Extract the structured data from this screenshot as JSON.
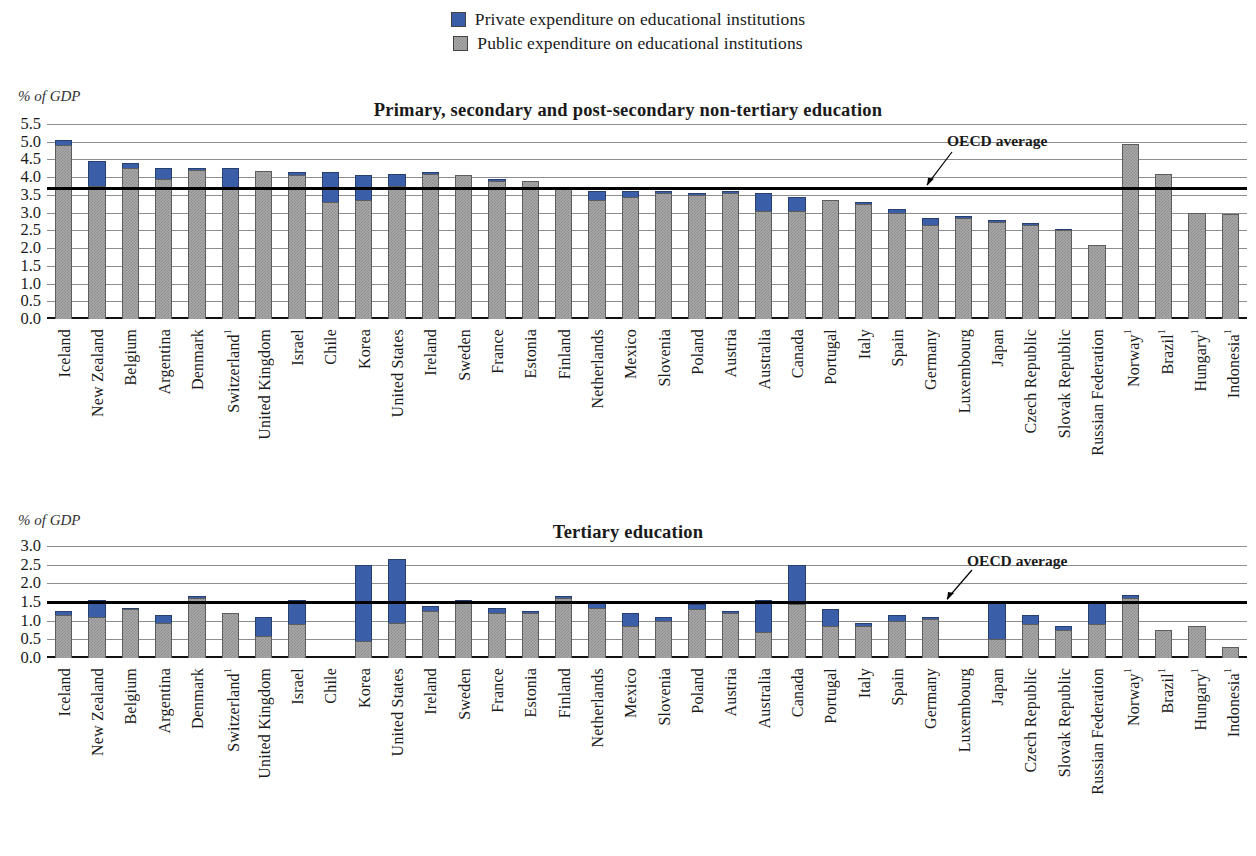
{
  "legend": {
    "items": [
      {
        "label": "Private expenditure on educational institutions",
        "color": "#3a5fa8",
        "key": "private"
      },
      {
        "label": "Public expenditure on educational institutions",
        "color": "#a9a9a9",
        "key": "public"
      }
    ]
  },
  "panels": [
    {
      "id": "top",
      "title": "Primary, secondary and post-secondary non-tertiary education",
      "axis_label": "% of GDP",
      "oecd_label": "OECD average"
    },
    {
      "id": "bottom",
      "title": "Tertiary education",
      "axis_label": "% of GDP",
      "oecd_label": "OECD average"
    }
  ],
  "chart_data": [
    {
      "type": "bar",
      "stacked": true,
      "title": "Primary, secondary and post-secondary non-tertiary education",
      "xlabel": "",
      "ylabel": "% of GDP",
      "ylim": [
        0.0,
        5.5
      ],
      "yticks": [
        "0.0",
        "0.5",
        "1.0",
        "1.5",
        "2.0",
        "2.5",
        "3.0",
        "3.5",
        "4.0",
        "4.5",
        "5.0",
        "5.5"
      ],
      "grid": true,
      "legend_position": "top-center",
      "annotations": [
        {
          "text": "OECD average",
          "value": 3.7
        }
      ],
      "oecd_average": 3.7,
      "categories": [
        "Iceland",
        "New Zealand",
        "Belgium",
        "Argentina",
        "Denmark",
        "Switzerland¹",
        "United Kingdom",
        "Israel",
        "Chile",
        "Korea",
        "United States",
        "Ireland",
        "Sweden",
        "France",
        "Estonia",
        "Finland",
        "Netherlands",
        "Mexico",
        "Slovenia",
        "Poland",
        "Austria",
        "Australia",
        "Canada",
        "Portugal",
        "Italy",
        "Spain",
        "Germany",
        "Luxembourg",
        "Japan",
        "Czech Republic",
        "Slovak Republic",
        "Russian Federation",
        "Norway¹",
        "Brazil¹",
        "Hungary¹",
        "Indonesia¹"
      ],
      "series": [
        {
          "name": "Public expenditure on educational institutions",
          "values": [
            4.9,
            3.75,
            4.25,
            3.95,
            4.2,
            3.7,
            4.18,
            4.05,
            3.3,
            3.35,
            3.75,
            4.1,
            4.05,
            3.9,
            3.9,
            3.7,
            3.35,
            3.45,
            3.55,
            3.5,
            3.55,
            3.05,
            3.05,
            3.35,
            3.25,
            3.0,
            2.65,
            2.85,
            2.75,
            2.65,
            2.5,
            2.1,
            4.95,
            4.1,
            3.0,
            2.95
          ]
        },
        {
          "name": "Private expenditure on educational institutions",
          "values": [
            0.15,
            0.7,
            0.15,
            0.3,
            0.05,
            0.55,
            0.0,
            0.1,
            0.85,
            0.7,
            0.35,
            0.05,
            0.0,
            0.05,
            0.0,
            0.0,
            0.25,
            0.15,
            0.05,
            0.05,
            0.05,
            0.5,
            0.4,
            0.0,
            0.05,
            0.1,
            0.2,
            0.05,
            0.05,
            0.05,
            0.05,
            0.0,
            0.0,
            0.0,
            0.0,
            0.0
          ]
        }
      ]
    },
    {
      "type": "bar",
      "stacked": true,
      "title": "Tertiary education",
      "xlabel": "",
      "ylabel": "% of GDP",
      "ylim": [
        0.0,
        3.0
      ],
      "yticks": [
        "0.0",
        "0.5",
        "1.0",
        "1.5",
        "2.0",
        "2.5",
        "3.0"
      ],
      "grid": true,
      "legend_position": "top-center",
      "annotations": [
        {
          "text": "OECD average",
          "value": 1.5
        }
      ],
      "oecd_average": 1.5,
      "categories": [
        "Iceland",
        "New Zealand",
        "Belgium",
        "Argentina",
        "Denmark",
        "Switzerland¹",
        "United Kingdom",
        "Israel",
        "Chile",
        "Korea",
        "United States",
        "Ireland",
        "Sweden",
        "France",
        "Estonia",
        "Finland",
        "Netherlands",
        "Mexico",
        "Slovenia",
        "Poland",
        "Austria",
        "Australia",
        "Canada",
        "Portugal",
        "Italy",
        "Spain",
        "Germany",
        "Luxembourg",
        "Japan",
        "Czech Republic",
        "Slovak Republic",
        "Russian Federation",
        "Norway¹",
        "Brazil¹",
        "Hungary¹",
        "Indonesia¹"
      ],
      "series": [
        {
          "name": "Public expenditure on educational institutions",
          "values": [
            1.15,
            1.1,
            1.3,
            0.95,
            1.6,
            1.2,
            0.6,
            0.9,
            null,
            0.45,
            0.95,
            1.25,
            1.5,
            1.2,
            1.2,
            1.6,
            1.35,
            0.85,
            1.0,
            1.3,
            1.2,
            0.7,
            1.45,
            0.85,
            0.85,
            1.0,
            1.05,
            null,
            0.5,
            0.9,
            0.75,
            0.9,
            1.6,
            0.75,
            0.85,
            0.3
          ]
        },
        {
          "name": "Private expenditure on educational institutions",
          "values": [
            0.1,
            0.45,
            0.05,
            0.2,
            0.05,
            0.0,
            0.5,
            0.65,
            null,
            2.05,
            1.7,
            0.15,
            0.05,
            0.15,
            0.05,
            0.05,
            0.15,
            0.35,
            0.1,
            0.15,
            0.05,
            0.85,
            1.05,
            0.45,
            0.1,
            0.15,
            0.05,
            null,
            1.0,
            0.25,
            0.1,
            0.6,
            0.1,
            0.0,
            0.0,
            0.0
          ]
        }
      ]
    }
  ]
}
